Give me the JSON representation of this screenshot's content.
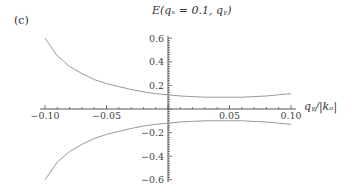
{
  "panel_label": "(c)",
  "title_display": "E(qₓ = 0.1, qᵧ)",
  "xlabel_display": "qᵧ/|kₐ|",
  "chart_data": {
    "type": "line",
    "xlabel": "q_y/|k_A|",
    "ylabel": "",
    "xlim": [
      -0.1,
      0.1
    ],
    "ylim": [
      -0.6,
      0.6
    ],
    "x_ticks": [
      "-0.10",
      "-0.05",
      "0.05",
      "0.10"
    ],
    "y_ticks": [
      "0.6",
      "0.4",
      "0.2",
      "-0.2",
      "-0.4",
      "-0.6"
    ],
    "grid": false,
    "x": [
      -0.1,
      -0.09,
      -0.08,
      -0.07,
      -0.06,
      -0.05,
      -0.04,
      -0.03,
      -0.02,
      -0.01,
      0.0,
      0.01,
      0.02,
      0.03,
      0.04,
      0.05,
      0.06,
      0.07,
      0.08,
      0.09,
      0.1
    ],
    "series": [
      {
        "name": "upper band",
        "values": [
          0.6,
          0.45,
          0.36,
          0.3,
          0.25,
          0.215,
          0.19,
          0.165,
          0.145,
          0.13,
          0.12,
          0.11,
          0.105,
          0.1,
          0.1,
          0.1,
          0.1,
          0.105,
          0.11,
          0.12,
          0.13
        ]
      },
      {
        "name": "lower band",
        "values": [
          -0.6,
          -0.45,
          -0.36,
          -0.3,
          -0.25,
          -0.215,
          -0.19,
          -0.165,
          -0.145,
          -0.13,
          -0.12,
          -0.11,
          -0.105,
          -0.1,
          -0.1,
          -0.1,
          -0.1,
          -0.105,
          -0.11,
          -0.12,
          -0.13
        ]
      }
    ]
  }
}
